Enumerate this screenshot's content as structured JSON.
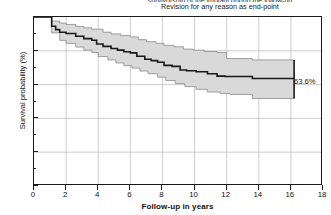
{
  "figure": {
    "title_cut_line": "survivorship of the implant during the follow-up",
    "title": "Revision for any reason as end-point",
    "end_annotation": "63.6%"
  },
  "chart_data": {
    "type": "line",
    "subtype": "kaplan-meier-survival-with-confidence-band",
    "title": "Revision for any reason as end-point",
    "xlabel": "Follow-up in years",
    "ylabel": "Survival probability (%)",
    "xlim": [
      0,
      18
    ],
    "ylim": [
      0,
      100
    ],
    "xticks": [
      0,
      2,
      4,
      6,
      8,
      10,
      12,
      14,
      16,
      18
    ],
    "xtick_labels": [
      "0",
      "2",
      "4",
      "6",
      "8",
      "10",
      "12",
      "14",
      "16",
      "18"
    ],
    "yticks": [
      0,
      20,
      40,
      60,
      80,
      100
    ],
    "ytick_labels": [
      "0",
      "20",
      "40",
      "60",
      "80",
      "100"
    ],
    "y_minor_ticks": [
      10,
      30,
      50,
      70,
      90
    ],
    "grid": true,
    "grid_color": "#b9b9b9",
    "legend": null,
    "line_color": "#1a1a1a",
    "band_fill": "#d9d9d9",
    "band_edge": "#8a8a8a",
    "annotations": [
      {
        "text": "63.6%",
        "x": 16.2,
        "y": 63.6,
        "type": "end-point-label"
      }
    ],
    "series": [
      {
        "name": "Survival estimate",
        "step": "post",
        "x": [
          0,
          0.9,
          1.1,
          1.35,
          1.6,
          2.0,
          2.6,
          3.1,
          3.6,
          3.9,
          4.3,
          4.8,
          5.2,
          5.6,
          6.0,
          6.4,
          6.9,
          7.3,
          7.7,
          8.1,
          8.6,
          9.1,
          9.5,
          10.1,
          10.8,
          11.4,
          11.9,
          13.6,
          16.2
        ],
        "y": [
          100,
          100,
          94.5,
          92.5,
          91.0,
          90.2,
          88.6,
          87.2,
          86.2,
          84.0,
          82.6,
          81.4,
          80.4,
          79.4,
          78.8,
          76.8,
          75.0,
          74.2,
          73.2,
          71.4,
          70.8,
          68.6,
          68.2,
          67.6,
          66.4,
          65.0,
          64.8,
          63.6,
          63.6
        ]
      },
      {
        "name": "Upper 95% CI",
        "step": "post",
        "x": [
          0,
          0.9,
          1.1,
          1.6,
          2.0,
          2.6,
          3.1,
          3.6,
          4.3,
          4.8,
          5.4,
          6.0,
          6.5,
          7.0,
          7.6,
          8.1,
          8.7,
          9.3,
          9.9,
          10.6,
          11.4,
          12.0,
          13.6,
          16.2
        ],
        "y": [
          100,
          100,
          97.6,
          96.4,
          95.6,
          94.4,
          93.6,
          92.8,
          91.0,
          90.0,
          89.0,
          88.2,
          86.6,
          85.4,
          84.4,
          83.2,
          82.4,
          81.0,
          80.4,
          79.6,
          79.0,
          75.4,
          74.6,
          74.6
        ]
      },
      {
        "name": "Lower 95% CI",
        "step": "post",
        "x": [
          0,
          0.9,
          1.1,
          1.6,
          2.0,
          2.6,
          3.1,
          3.6,
          4.0,
          4.6,
          5.1,
          5.6,
          6.1,
          6.6,
          7.1,
          7.7,
          8.2,
          8.8,
          9.4,
          10.1,
          10.8,
          11.6,
          12.2,
          13.6,
          16.2
        ],
        "y": [
          100,
          100,
          90.6,
          86.2,
          84.4,
          82.2,
          80.4,
          79.0,
          76.6,
          74.6,
          72.8,
          71.2,
          69.8,
          68.0,
          66.4,
          64.4,
          62.4,
          60.6,
          58.8,
          57.2,
          55.6,
          54.8,
          54.2,
          51.8,
          51.8
        ]
      }
    ]
  }
}
